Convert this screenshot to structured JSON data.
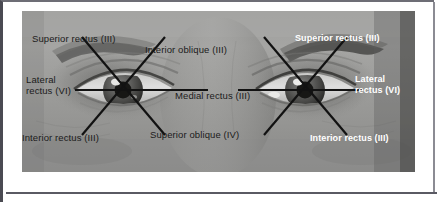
{
  "figure": {
    "type": "anatomical-photo-diagram",
    "photo": {
      "description": "Close-up grayscale photograph of a person's two eyes and surrounding face"
    },
    "colors": {
      "label_dark": "#1b1b1b",
      "label_light": "#ffffff",
      "leader_line": "#121212",
      "frame_border": "#4a4a52",
      "card_background": "#ffffff"
    },
    "labels": [
      {
        "id": "superior-rectus-left",
        "text": "Superior rectus (III)",
        "style": "dark",
        "eye": "left"
      },
      {
        "id": "inferior-oblique",
        "text": "Interior oblique (III)",
        "style": "dark",
        "eye": "left"
      },
      {
        "id": "superior-rectus-right",
        "text": "Superior rectus (III)",
        "style": "light",
        "eye": "right"
      },
      {
        "id": "lateral-rectus-left",
        "text": "Lateral\nrectus (VI)",
        "style": "dark",
        "eye": "left"
      },
      {
        "id": "medial-rectus",
        "text": "Medial rectus (III)",
        "style": "dark",
        "eye": "left"
      },
      {
        "id": "lateral-rectus-right",
        "text": "Lateral\nrectus (VI)",
        "style": "light",
        "eye": "right"
      },
      {
        "id": "inferior-rectus-left",
        "text": "Interior rectus (III)",
        "style": "dark",
        "eye": "left"
      },
      {
        "id": "superior-oblique",
        "text": "Superior oblique (IV)",
        "style": "dark",
        "eye": "left"
      },
      {
        "id": "inferior-rectus-right",
        "text": "Interior rectus (III)",
        "style": "light",
        "eye": "right"
      }
    ],
    "stars": [
      {
        "id": "left-eye-star",
        "center_x": 101,
        "center_y": 79,
        "ray_count": 6
      },
      {
        "id": "right-eye-star",
        "center_x": 283,
        "center_y": 79,
        "ray_count": 6
      }
    ]
  }
}
